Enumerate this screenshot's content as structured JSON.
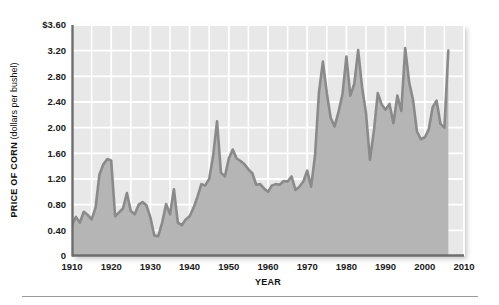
{
  "chart_data": {
    "type": "area",
    "title": "",
    "xlabel": "YEAR",
    "ylabel_bold": "PRICE OF CORN",
    "ylabel_plain": " (dollars per bushel)",
    "ylabel_full": "PRICE OF CORN (dollars per bushel)",
    "xlim": [
      1910,
      2010
    ],
    "ylim": [
      0,
      3.6
    ],
    "grid": true,
    "x_major_step": 10,
    "x_minor_step": 5,
    "y_major_step": 0.4,
    "legend": "none",
    "xticks": [
      1910,
      1920,
      1930,
      1940,
      1950,
      1960,
      1970,
      1980,
      1990,
      2000,
      2010
    ],
    "xtick_labels": [
      "1910",
      "1920",
      "1930",
      "1940",
      "1950",
      "1960",
      "1970",
      "1980",
      "1990",
      "2000",
      "2010"
    ],
    "yticks": [
      0,
      0.4,
      0.8,
      1.2,
      1.6,
      2.0,
      2.4,
      2.8,
      3.2,
      3.6
    ],
    "ytick_labels": [
      "0",
      "0.40",
      "0.80",
      "1.20",
      "1.60",
      "2.00",
      "2.40",
      "2.80",
      "3.20",
      "$3.60"
    ],
    "series": [
      {
        "name": "Price of corn",
        "x": [
          1910,
          1911,
          1912,
          1913,
          1914,
          1915,
          1916,
          1917,
          1918,
          1919,
          1920,
          1921,
          1922,
          1923,
          1924,
          1925,
          1926,
          1927,
          1928,
          1929,
          1930,
          1931,
          1932,
          1933,
          1934,
          1935,
          1936,
          1937,
          1938,
          1939,
          1940,
          1941,
          1942,
          1943,
          1944,
          1945,
          1946,
          1947,
          1948,
          1949,
          1950,
          1951,
          1952,
          1953,
          1954,
          1955,
          1956,
          1957,
          1958,
          1959,
          1960,
          1961,
          1962,
          1963,
          1964,
          1965,
          1966,
          1967,
          1968,
          1969,
          1970,
          1971,
          1972,
          1973,
          1974,
          1975,
          1976,
          1977,
          1978,
          1979,
          1980,
          1981,
          1982,
          1983,
          1984,
          1985,
          1986,
          1987,
          1988,
          1989,
          1990,
          1991,
          1992,
          1993,
          1994,
          1995,
          1996,
          1997,
          1998,
          1999,
          2000,
          2001,
          2002,
          2003,
          2004,
          2005,
          2006
        ],
        "values": [
          0.48,
          0.61,
          0.52,
          0.69,
          0.64,
          0.57,
          0.75,
          1.27,
          1.43,
          1.51,
          1.49,
          0.62,
          0.68,
          0.74,
          0.98,
          0.7,
          0.65,
          0.8,
          0.84,
          0.79,
          0.6,
          0.32,
          0.31,
          0.52,
          0.81,
          0.65,
          1.04,
          0.52,
          0.48,
          0.57,
          0.62,
          0.75,
          0.92,
          1.12,
          1.1,
          1.2,
          1.56,
          2.1,
          1.3,
          1.24,
          1.52,
          1.66,
          1.52,
          1.48,
          1.43,
          1.35,
          1.29,
          1.11,
          1.12,
          1.05,
          1.0,
          1.1,
          1.12,
          1.11,
          1.17,
          1.16,
          1.24,
          1.03,
          1.08,
          1.16,
          1.33,
          1.08,
          1.57,
          2.55,
          3.03,
          2.54,
          2.15,
          2.02,
          2.25,
          2.52,
          3.11,
          2.5,
          2.68,
          3.21,
          2.63,
          2.23,
          1.5,
          1.94,
          2.54,
          2.36,
          2.28,
          2.37,
          2.07,
          2.5,
          2.26,
          3.24,
          2.71,
          2.43,
          1.94,
          1.82,
          1.85,
          1.97,
          2.32,
          2.42,
          2.06,
          2.0,
          3.2
        ]
      }
    ],
    "colors": {
      "plot_background": "#e8e8e8",
      "area_fill": "#b5b5b5",
      "line": "#8a8a8a",
      "gridline": "#ffffff",
      "axis_line": "#6e6e6e",
      "tick_text": "#1a1a1a"
    }
  }
}
